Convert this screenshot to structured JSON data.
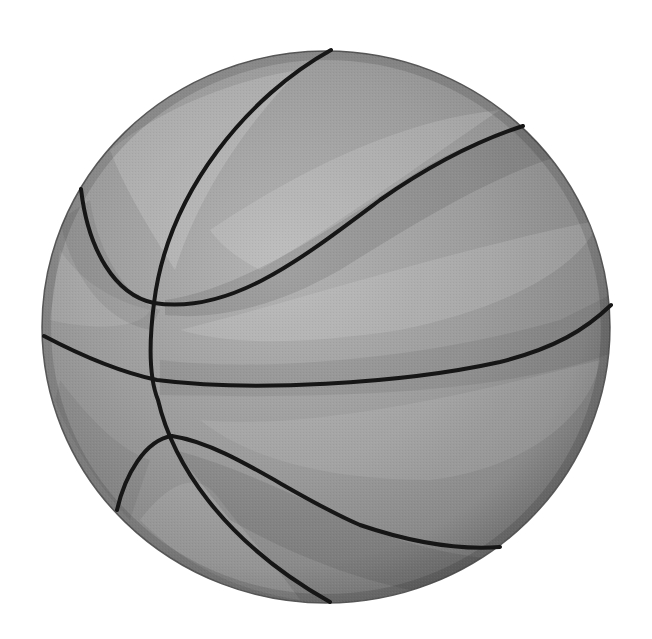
{
  "image": {
    "subject": "basketball",
    "style": "grayscale illustration",
    "width": 652,
    "height": 639,
    "background_color": "#ffffff",
    "alt_text": "Grayscale basketball"
  },
  "ball": {
    "center_x": 326,
    "center_y": 327,
    "radius_x": 285,
    "radius_y": 277,
    "base_color": "#9a9a9a",
    "highlight_color": "#bdbdbd",
    "shadow_color": "#6e6e6e",
    "rim_color": "#5a5a5a"
  },
  "seams": {
    "color": "#161616",
    "width": 4,
    "paths": [
      {
        "name": "seam-main-vertical",
        "d": "M 331 50 C 250 95, 168 190, 154 303 C 148 350, 150 380, 158 400 C 172 460, 220 540, 330 602"
      },
      {
        "name": "seam-upper-arc",
        "d": "M 81 189 C 88 250, 115 295, 154 303 C 230 315, 300 260, 380 200 C 430 165, 480 140, 523 126"
      },
      {
        "name": "seam-horizontal",
        "d": "M 44 336 C 80 355, 120 372, 157 380 C 250 392, 400 384, 500 362 C 555 348, 585 330, 611 305"
      },
      {
        "name": "seam-lower-arc",
        "d": "M 117 510 C 125 475, 145 440, 172 436 C 230 445, 290 495, 360 525 C 410 542, 460 550, 500 547"
      }
    ]
  }
}
